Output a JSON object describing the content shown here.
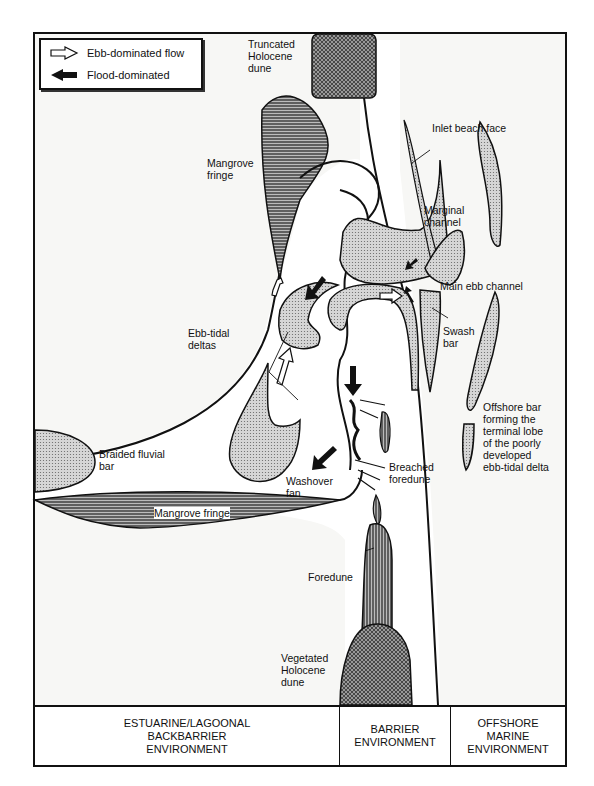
{
  "legend": {
    "items": [
      {
        "icon": "hollow-arrow-right-icon",
        "label": "Ebb-dominated flow"
      },
      {
        "icon": "solid-arrow-left-icon",
        "label": "Flood-dominated"
      }
    ]
  },
  "labels": {
    "truncated_dune": "Truncated\nHolocene\ndune",
    "inlet_beach_face": "Inlet beach face",
    "mangrove_fringe_top": "Mangrove\nfringe",
    "marginal_channel": "Marginal\nchannel",
    "main_ebb_channel": "Main ebb channel",
    "swash_bar": "Swash\nbar",
    "ebb_tidal_deltas": "Ebb-tidal\ndeltas",
    "offshore_bar": "Offshore bar\nforming the\nterminal lobe\nof the poorly\ndeveloped\nebb-tidal delta",
    "braided_fluvial_bar": "Braided fluvial\nbar",
    "washover_fan": "Washover\nfan",
    "breached_foredune": "Breached\nforedune",
    "mangrove_fringe_bottom": "Mangrove fringe",
    "foredune": "Foredune",
    "vegetated_dune": "Vegetated\nHolocene\ndune"
  },
  "footer": {
    "zones": [
      {
        "label": "ESTUARINE/LAGOONAL\nBACKBARRIER\nENVIRONMENT"
      },
      {
        "label": "BARRIER\nENVIRONMENT"
      },
      {
        "label": "OFFSHORE\nMARINE\nENVIRONMENT"
      }
    ]
  }
}
